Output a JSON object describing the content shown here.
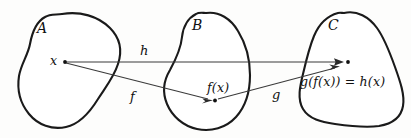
{
  "diagram": {
    "type": "set-mapping-diagram",
    "sets": [
      {
        "id": "A",
        "label": "A"
      },
      {
        "id": "B",
        "label": "B"
      },
      {
        "id": "C",
        "label": "C"
      }
    ],
    "points": [
      {
        "id": "x",
        "label": "x",
        "in_set": "A"
      },
      {
        "id": "fx",
        "label": "f(x)",
        "in_set": "B"
      },
      {
        "id": "gfx",
        "label": "g(f(x)) = h(x)",
        "in_set": "C"
      }
    ],
    "arrows": [
      {
        "id": "h",
        "label": "h",
        "from": "x",
        "to": "gfx",
        "from_set": "A",
        "to_set": "C"
      },
      {
        "id": "f",
        "label": "f",
        "from": "x",
        "to": "fx",
        "from_set": "A",
        "to_set": "B"
      },
      {
        "id": "g",
        "label": "g",
        "from": "fx",
        "to": "gfx",
        "from_set": "B",
        "to_set": "C"
      }
    ],
    "colors": {
      "blob_stroke": "#1a1a1a",
      "arrow_stroke": "#3a3a3a",
      "point_fill": "#111111",
      "background": "#fdfdfc"
    }
  }
}
